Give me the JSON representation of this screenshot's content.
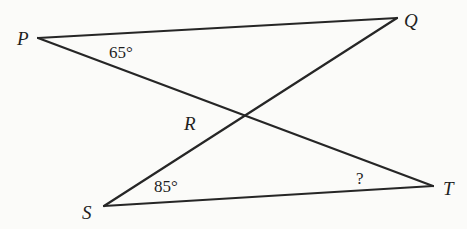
{
  "figure": {
    "type": "geometry",
    "points": {
      "P": {
        "label": "P",
        "x": 38,
        "y": 38
      },
      "Q": {
        "label": "Q",
        "x": 397,
        "y": 18
      },
      "S": {
        "label": "S",
        "x": 104,
        "y": 206
      },
      "T": {
        "label": "T",
        "x": 433,
        "y": 186
      },
      "R": {
        "label": "R",
        "x": 244,
        "y": 116
      }
    },
    "segments": [
      {
        "from": "P",
        "to": "Q"
      },
      {
        "from": "P",
        "to": "T"
      },
      {
        "from": "Q",
        "to": "S"
      },
      {
        "from": "S",
        "to": "T"
      }
    ],
    "angles": {
      "at_P": {
        "vertex": "P",
        "label": "65°"
      },
      "at_S": {
        "vertex": "S",
        "label": "85°"
      },
      "at_T": {
        "vertex": "T",
        "label": "?"
      }
    },
    "line_color": "#262626",
    "background": "#fbfbf9"
  }
}
